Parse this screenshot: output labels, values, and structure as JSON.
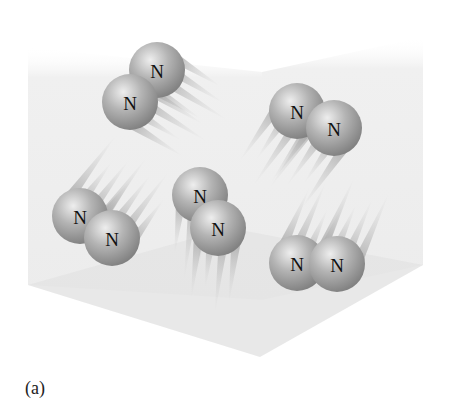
{
  "figure": {
    "caption": "(a)",
    "colors": {
      "background": "#ffffff",
      "wall": "#eeeeee",
      "floor": "#e4e4e4",
      "sphere_highlight": "#eeeeee",
      "sphere_mid": "#b4b4b4",
      "sphere_edge": "#7e7e7e",
      "label": "#111111"
    },
    "box": {
      "left_wall": [
        [
          28,
          47
        ],
        [
          262,
          72
        ],
        [
          262,
          300
        ],
        [
          28,
          285
        ]
      ],
      "right_wall": [
        [
          262,
          72
        ],
        [
          423,
          37
        ],
        [
          423,
          265
        ],
        [
          262,
          300
        ]
      ],
      "floor": [
        [
          28,
          285
        ],
        [
          230,
          228
        ],
        [
          423,
          265
        ],
        [
          260,
          357
        ]
      ]
    },
    "atom_radius": 28,
    "molecules": [
      {
        "name": "molecule-top-left",
        "atoms": [
          {
            "label": "N",
            "cx": 157,
            "cy": 70
          },
          {
            "label": "N",
            "cx": 130,
            "cy": 102
          }
        ],
        "trail_dir": [
          1,
          0.62
        ]
      },
      {
        "name": "molecule-top-right",
        "atoms": [
          {
            "label": "N",
            "cx": 297,
            "cy": 111
          },
          {
            "label": "N",
            "cx": 334,
            "cy": 128
          }
        ],
        "trail_dir": [
          -0.7,
          1
        ]
      },
      {
        "name": "molecule-bottom-left",
        "atoms": [
          {
            "label": "N",
            "cx": 80,
            "cy": 216
          },
          {
            "label": "N",
            "cx": 112,
            "cy": 238
          }
        ],
        "trail_dir": [
          0.75,
          -1
        ]
      },
      {
        "name": "molecule-middle",
        "atoms": [
          {
            "label": "N",
            "cx": 200,
            "cy": 195
          },
          {
            "label": "N",
            "cx": 218,
            "cy": 228
          }
        ],
        "trail_dir": [
          -0.12,
          1
        ]
      },
      {
        "name": "molecule-bottom-right",
        "atoms": [
          {
            "label": "N",
            "cx": 297,
            "cy": 263
          },
          {
            "label": "N",
            "cx": 337,
            "cy": 264
          }
        ],
        "trail_dir": [
          0.45,
          -1
        ]
      }
    ]
  }
}
